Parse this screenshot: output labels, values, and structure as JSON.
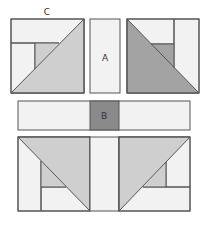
{
  "diagram": {
    "labels": {
      "c": "C",
      "a": "A",
      "b": "B"
    },
    "colors": {
      "background": "#ffffff",
      "light": "#f2f2f2",
      "medium": "#cfcfcf",
      "dark": "#a3a3a3",
      "b_square": "#8a8a8a",
      "stroke": "#555555"
    },
    "rows": [
      {
        "name": "top-row",
        "pieces": [
          "half-square-triangle-unit-c",
          "strip-a",
          "half-square-triangle-unit-dark"
        ]
      },
      {
        "name": "middle-row",
        "pieces": [
          "strip-left",
          "square-b",
          "strip-right"
        ]
      },
      {
        "name": "bottom-row",
        "pieces": [
          "half-square-triangle-unit-bottom-left",
          "strip-center",
          "half-square-triangle-unit-bottom-right"
        ]
      }
    ]
  }
}
